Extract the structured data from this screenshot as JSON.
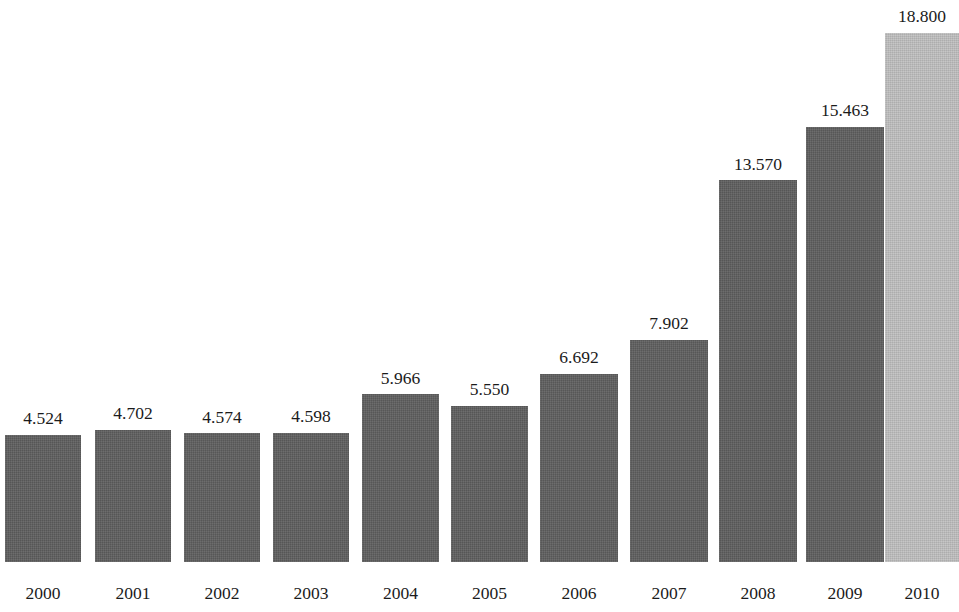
{
  "chart_data": {
    "type": "bar",
    "title": "",
    "subtitle": "",
    "xlabel": "",
    "ylabel": "",
    "grid": false,
    "legend": false,
    "axis_lines": false,
    "ylim": [
      0,
      18.8
    ],
    "value_label_format": "comma-decimal",
    "categories": [
      "2000",
      "2001",
      "2002",
      "2003",
      "2004",
      "2005",
      "2006",
      "2007",
      "2008",
      "2009",
      "2010"
    ],
    "values": [
      4.524,
      4.702,
      4.574,
      4.598,
      5.966,
      5.55,
      6.692,
      7.902,
      13.57,
      15.463,
      18.8
    ],
    "value_labels": [
      "4.524",
      "4.702",
      "4.574",
      "4.598",
      "5.966",
      "5.550",
      "6.692",
      "7.902",
      "13.570",
      "15.463",
      "18.800"
    ],
    "bar_colors": [
      "#5e5e5e",
      "#5e5e5e",
      "#5e5e5e",
      "#5e5e5e",
      "#5e5e5e",
      "#5e5e5e",
      "#5e5e5e",
      "#5e5e5e",
      "#5e5e5e",
      "#5e5e5e",
      "#b9b9b9"
    ],
    "series": [
      {
        "name": "",
        "values": [
          4.524,
          4.702,
          4.574,
          4.598,
          5.966,
          5.55,
          6.692,
          7.902,
          13.57,
          15.463,
          18.8
        ]
      }
    ],
    "bars": [
      {
        "category": "2000",
        "value": 4.524,
        "label": "4.524",
        "color": "#5e5e5e",
        "x": 5,
        "width": 76
      },
      {
        "category": "2001",
        "value": 4.702,
        "label": "4.702",
        "color": "#5e5e5e",
        "x": 95,
        "width": 76
      },
      {
        "category": "2002",
        "value": 4.574,
        "label": "4.574",
        "color": "#5e5e5e",
        "x": 184,
        "width": 76
      },
      {
        "category": "2003",
        "value": 4.598,
        "label": "4.598",
        "color": "#5e5e5e",
        "x": 273,
        "width": 76
      },
      {
        "category": "2004",
        "value": 5.966,
        "label": "5.966",
        "color": "#5e5e5e",
        "x": 362,
        "width": 77
      },
      {
        "category": "2005",
        "value": 5.55,
        "label": "5.550",
        "color": "#5e5e5e",
        "x": 451,
        "width": 77
      },
      {
        "category": "2006",
        "value": 6.692,
        "label": "6.692",
        "color": "#5e5e5e",
        "x": 540,
        "width": 78
      },
      {
        "category": "2007",
        "value": 7.902,
        "label": "7.902",
        "color": "#5e5e5e",
        "x": 630,
        "width": 78
      },
      {
        "category": "2008",
        "value": 13.57,
        "label": "13.570",
        "color": "#5e5e5e",
        "x": 719,
        "width": 78
      },
      {
        "category": "2009",
        "value": 15.463,
        "label": "15.463",
        "color": "#5e5e5e",
        "x": 806,
        "width": 78
      },
      {
        "category": "2010",
        "value": 18.8,
        "label": "18.800",
        "color": "#b9b9b9",
        "x": 885,
        "width": 74
      }
    ]
  },
  "geometry": {
    "baseline_y": 562,
    "pixels_per_unit": 28.15
  }
}
